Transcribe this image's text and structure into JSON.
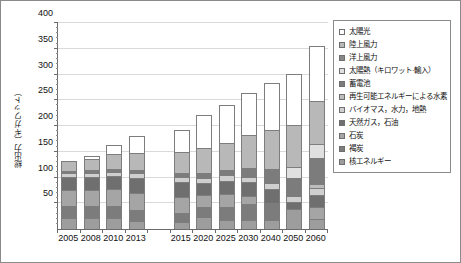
{
  "chart_data": {
    "type": "bar",
    "stacked": true,
    "title": "",
    "xlabel": "",
    "ylabel": "総出力（ギガワット）",
    "ylim": [
      0,
      400
    ],
    "yticks": [
      0,
      50,
      100,
      150,
      200,
      250,
      300,
      350,
      400
    ],
    "ytick_labels": [
      "",
      "50",
      "100",
      "150",
      "200",
      "250",
      "300",
      "350",
      "400"
    ],
    "grid": true,
    "legend_position": "right",
    "categories": [
      "2005",
      "2008",
      "2010",
      "2013",
      "",
      "2015",
      "2020",
      "2025",
      "2030",
      "2040",
      "2050",
      "2060"
    ],
    "series": [
      {
        "name": "核エネルギー",
        "color": "#9d9d9d",
        "values": [
          21,
          21,
          22,
          15,
          null,
          14,
          23,
          17,
          17,
          17,
          39,
          20
        ]
      },
      {
        "name": "褐炭",
        "color": "#7c7c7c",
        "values": [
          23,
          23,
          23,
          22,
          null,
          17,
          19,
          25,
          32,
          34,
          0,
          0
        ]
      },
      {
        "name": "石炭",
        "color": "#a5a5a5",
        "values": [
          32,
          32,
          32,
          32,
          null,
          32,
          24,
          26,
          16,
          0,
          0,
          22
        ]
      },
      {
        "name": "天然ガス, 石油",
        "color": "#6f6f6f",
        "values": [
          26,
          26,
          26,
          30,
          null,
          28,
          23,
          25,
          26,
          27,
          13,
          25
        ]
      },
      {
        "name": "バイオマス, 水力, 地熱",
        "color": "#cfcfcf",
        "values": [
          6,
          7,
          8,
          9,
          null,
          10,
          11,
          11,
          11,
          11,
          12,
          12
        ]
      },
      {
        "name": "再生可能エネルギーによる水素",
        "color": "#bcbcbc",
        "values": [
          0,
          0,
          0,
          0,
          null,
          0,
          0,
          0,
          0,
          0,
          0,
          8
        ]
      },
      {
        "name": "蓄電池",
        "color": "#7c7c7c",
        "values": [
          5,
          5,
          6,
          7,
          null,
          8,
          9,
          11,
          16,
          27,
          35,
          51
        ]
      },
      {
        "name": "太陽熱（キロワット·輸入）",
        "color": "#e0e0e0",
        "values": [
          0,
          0,
          0,
          0,
          null,
          0,
          0,
          0,
          0,
          0,
          21,
          27
        ]
      },
      {
        "name": "洋上風力",
        "color": "#878787",
        "values": [
          0,
          0,
          0,
          0,
          null,
          0,
          0,
          0,
          0,
          0,
          0,
          0
        ]
      },
      {
        "name": "陸上風力",
        "color": "#b8b8b8",
        "values": [
          19,
          22,
          28,
          33,
          null,
          40,
          48,
          52,
          65,
          77,
          82,
          83
        ]
      },
      {
        "name": "太陽光",
        "color": "#ffffff",
        "values": [
          0,
          6,
          18,
          32,
          null,
          43,
          64,
          73,
          82,
          90,
          100,
          108
        ]
      }
    ],
    "totals": [
      133,
      148,
      168,
      181,
      null,
      193,
      221,
      240,
      264,
      298,
      331,
      370
    ]
  },
  "legend": {
    "items": [
      {
        "label": "太陽光",
        "swatch": "#ffffff"
      },
      {
        "label": "陸上風力",
        "swatch": "#b8b8b8"
      },
      {
        "label": "洋上風力",
        "swatch": "#878787"
      },
      {
        "label": "太陽熱（キロワット·輸入）",
        "swatch": "#e0e0e0"
      },
      {
        "label": "蓄電池",
        "swatch": "#7c7c7c"
      },
      {
        "label": "再生可能エネルギーによる水素",
        "swatch": "#bcbcbc"
      },
      {
        "label": "バイオマス，水力，地熱",
        "swatch": "#cfcfcf"
      },
      {
        "label": "天然ガス，石油",
        "swatch": "#6f6f6f"
      },
      {
        "label": "石炭",
        "swatch": "#a5a5a5"
      },
      {
        "label": "褐炭",
        "swatch": "#7c7c7c"
      },
      {
        "label": "核エネルギー",
        "swatch": "#9d9d9d"
      }
    ]
  }
}
